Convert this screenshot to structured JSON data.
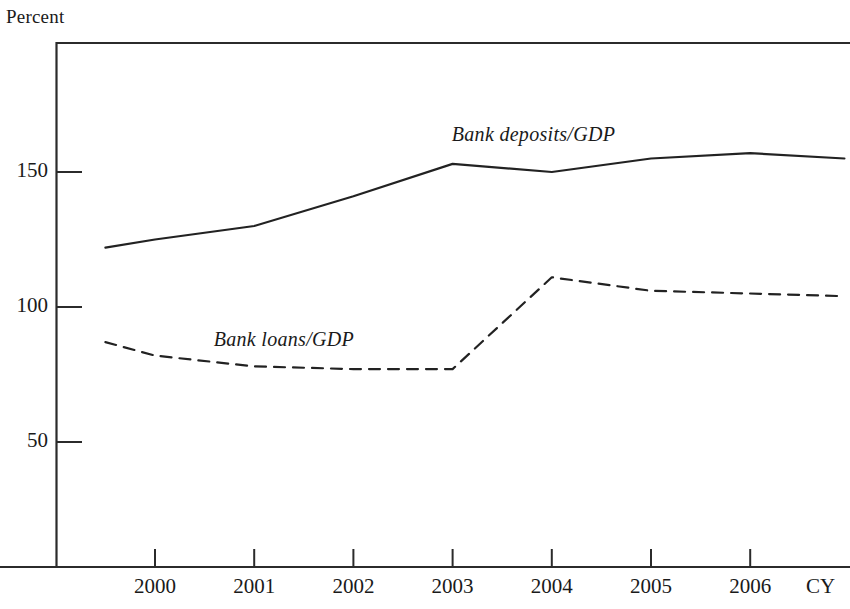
{
  "chart_data": {
    "type": "line",
    "title": "",
    "ylabel": "Percent",
    "xlabel": "CY",
    "ylim": [
      0,
      185
    ],
    "yticks": [
      50,
      100,
      150
    ],
    "ytick_labels": [
      "50",
      "100",
      "150"
    ],
    "grid": false,
    "legend_position": "inline-annotations",
    "x": [
      1999.5,
      2000,
      2001,
      2002,
      2003,
      2004,
      2005,
      2006,
      2006.95
    ],
    "xticks": [
      2000,
      2001,
      2002,
      2003,
      2004,
      2005,
      2006
    ],
    "xtick_labels": [
      "2000",
      "2001",
      "2002",
      "2003",
      "2004",
      "2005",
      "2006"
    ],
    "series": [
      {
        "name": "Bank deposits/GDP",
        "style": "solid",
        "color": "#222222",
        "values": [
          122,
          125,
          130,
          141,
          153,
          150,
          155,
          157,
          155
        ]
      },
      {
        "name": "Bank loans/GDP",
        "style": "dashed",
        "color": "#222222",
        "values": [
          87,
          82,
          78,
          77,
          77,
          111,
          106,
          105,
          104
        ]
      }
    ],
    "annotations": [
      {
        "text": "Bank deposits/GDP",
        "x": 2004.0,
        "y": 163
      },
      {
        "text": "Bank loans/GDP",
        "x": 2001.6,
        "y": 87
      }
    ]
  },
  "axes": {
    "unit_label": "Percent",
    "x_caption": "CY"
  }
}
